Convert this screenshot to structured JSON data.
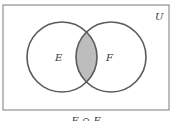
{
  "diagram": {
    "type": "venn",
    "universe_label": "U",
    "sets": [
      {
        "label": "E",
        "cx": 62,
        "cy": 57,
        "r": 35
      },
      {
        "label": "F",
        "cx": 111,
        "cy": 57,
        "r": 35
      }
    ],
    "shaded_region": "E ∩ F",
    "caption": "E ∩ F",
    "colors": {
      "stroke": "#5a5a5a",
      "shade": "#bdbdbd",
      "border": "#7a7a7a",
      "background": "#ffffff"
    }
  }
}
